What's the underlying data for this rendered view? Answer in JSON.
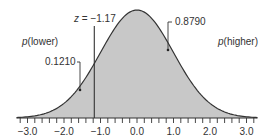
{
  "chart_data": {
    "type": "area",
    "title": "",
    "xlabel": "",
    "ylabel": "",
    "distribution": "standard normal",
    "xlim": [
      -3.3,
      3.3
    ],
    "x_ticks": [
      "-3.0",
      "-2.0",
      "-1.0",
      "0.0",
      "1.0",
      "2.0",
      "3.0"
    ],
    "x_tick_values": [
      -3.0,
      -2.0,
      -1.0,
      0.0,
      1.0,
      2.0,
      3.0
    ],
    "minor_tick_step": 0.2,
    "grid": false,
    "cutoff": {
      "z": -1.17,
      "label_prefix": "z",
      "label_value": "= −1.17"
    },
    "regions": [
      {
        "name": "p(lower)",
        "label": "p",
        "label_paren": "(lower)",
        "probability": 0.121,
        "value_label": "0.1210"
      },
      {
        "name": "p(higher)",
        "label": "p",
        "label_paren": "(higher)",
        "probability": 0.879,
        "value_label": "0.8790"
      }
    ],
    "fill_color": "#c8c8c8",
    "line_color": "#333333"
  }
}
